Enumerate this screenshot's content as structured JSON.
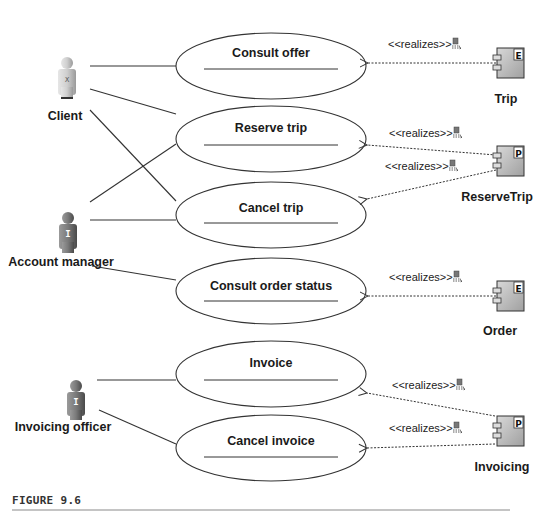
{
  "figure": {
    "caption": "FIGURE 9.6"
  },
  "actors": [
    {
      "id": "client",
      "label": "Client",
      "badge": "X"
    },
    {
      "id": "account_manager",
      "label": "Account manager",
      "badge": "I"
    },
    {
      "id": "invoicing_officer",
      "label": "Invoicing officer",
      "badge": "I"
    }
  ],
  "use_cases": [
    {
      "id": "consult_offer",
      "label": "Consult offer"
    },
    {
      "id": "reserve_trip",
      "label": "Reserve trip"
    },
    {
      "id": "cancel_trip",
      "label": "Cancel trip"
    },
    {
      "id": "consult_order_status",
      "label": "Consult order status"
    },
    {
      "id": "invoice",
      "label": "Invoice"
    },
    {
      "id": "cancel_invoice",
      "label": "Cancel invoice"
    }
  ],
  "components": [
    {
      "id": "trip",
      "label": "Trip",
      "badge": "E"
    },
    {
      "id": "reservetrip",
      "label": "ReserveTrip",
      "badge": "P"
    },
    {
      "id": "order",
      "label": "Order",
      "badge": "E"
    },
    {
      "id": "invoicing",
      "label": "Invoicing",
      "badge": "P"
    }
  ],
  "realizations": [
    {
      "from": "trip",
      "to": "consult_offer",
      "label": "<<realizes>>"
    },
    {
      "from": "reservetrip",
      "to": "reserve_trip",
      "label": "<<realizes>>"
    },
    {
      "from": "reservetrip",
      "to": "cancel_trip",
      "label": "<<realizes>>"
    },
    {
      "from": "order",
      "to": "consult_order_status",
      "label": "<<realizes>>"
    },
    {
      "from": "invoicing",
      "to": "invoice",
      "label": "<<realizes>>"
    },
    {
      "from": "invoicing",
      "to": "cancel_invoice",
      "label": "<<realizes>>"
    }
  ],
  "associations": [
    {
      "actor": "client",
      "use_case": "consult_offer"
    },
    {
      "actor": "client",
      "use_case": "reserve_trip"
    },
    {
      "actor": "client",
      "use_case": "cancel_trip"
    },
    {
      "actor": "account_manager",
      "use_case": "reserve_trip"
    },
    {
      "actor": "account_manager",
      "use_case": "cancel_trip"
    },
    {
      "actor": "account_manager",
      "use_case": "consult_order_status"
    },
    {
      "actor": "invoicing_officer",
      "use_case": "invoice"
    },
    {
      "actor": "invoicing_officer",
      "use_case": "cancel_invoice"
    }
  ],
  "colors": {
    "line": "#333333",
    "actor_light": "#c8c8c8",
    "actor_dark": "#6e6e6e",
    "component_fill": "#b8b8b8",
    "caption_rule": "#8a8a8a"
  }
}
